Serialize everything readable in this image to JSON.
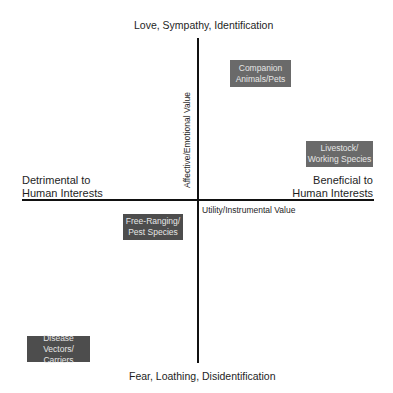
{
  "diagram": {
    "type": "quadrant",
    "poles": {
      "top": "Love, Sympathy, Identification",
      "bottom": "Fear, Loathing, Disidentification",
      "left": [
        "Detrimental to",
        "Human Interests"
      ],
      "right": [
        "Beneficial to",
        "Human Interests"
      ]
    },
    "axes": {
      "vertical_label": "Affective/Emotional Value",
      "horizontal_label": "Utility/Instrumental Value"
    },
    "categories": [
      {
        "lines": [
          "Companion",
          "Animals/Pets"
        ],
        "quadrant": "top-right"
      },
      {
        "lines": [
          "Livestock/",
          "Working Species"
        ],
        "quadrant": "top-right"
      },
      {
        "lines": [
          "Free-Ranging/",
          "Pest Species"
        ],
        "quadrant": "bottom-left"
      },
      {
        "lines": [
          "Disease Vectors/",
          "Carriers"
        ],
        "quadrant": "bottom-left"
      }
    ],
    "colors": {
      "box_fill": "#6a6a6a",
      "box_fill_dark": "#4d4d4d",
      "box_text": "#e6e6e6",
      "axis": "#111111"
    }
  }
}
